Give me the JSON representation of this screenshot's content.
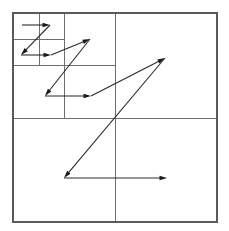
{
  "figure": {
    "background_color": "#ffffff",
    "line_color": "#6e6e6e",
    "frame_color": "#5a5a5a",
    "curve_color": "#2b2b2b",
    "arrow_color": "#1a1a1a"
  },
  "chart_data": {
    "type": "diagram",
    "subtype": "quadtree-z-order-curve",
    "xlabel": "",
    "ylabel": "",
    "grid": true,
    "legend": "none",
    "viewbox": {
      "x": 0,
      "y": 0,
      "width": 229,
      "height": 231
    },
    "domain": {
      "x0": 13,
      "y0": 13,
      "x1": 217,
      "y1": 222
    },
    "refinement_levels": 3,
    "split_points": [
      {
        "level": 1,
        "x": 115,
        "y": 118,
        "label": "root-split"
      },
      {
        "level": 2,
        "x": 64,
        "y": 65,
        "label": "top-left-quadrant-split"
      },
      {
        "level": 3,
        "x": 39,
        "y": 39,
        "label": "top-left-subquadrant-split"
      }
    ],
    "grid_lines": [
      {
        "name": "level1-vertical",
        "x1": 115,
        "y1": 13,
        "x2": 115,
        "y2": 222
      },
      {
        "name": "level1-horizontal",
        "x1": 13,
        "y1": 118,
        "x2": 217,
        "y2": 118
      },
      {
        "name": "level2-vertical",
        "x1": 64,
        "y1": 13,
        "x2": 64,
        "y2": 118
      },
      {
        "name": "level2-horizontal",
        "x1": 13,
        "y1": 65,
        "x2": 115,
        "y2": 65
      },
      {
        "name": "level3-vertical",
        "x1": 39,
        "y1": 13,
        "x2": 39,
        "y2": 65
      },
      {
        "name": "level3-horizontal",
        "x1": 13,
        "y1": 39,
        "x2": 64,
        "y2": 39
      }
    ],
    "curves": [
      {
        "name": "level3-z-curve",
        "level": 3,
        "order": [
          "nw",
          "ne",
          "sw",
          "se"
        ],
        "points": [
          {
            "x": 22,
            "y": 25
          },
          {
            "x": 50,
            "y": 25
          },
          {
            "x": 21,
            "y": 55
          },
          {
            "x": 51,
            "y": 55
          }
        ],
        "segments": [
          {
            "from": {
              "x": 22,
              "y": 25
            },
            "to": {
              "x": 50,
              "y": 25
            },
            "arrow": true,
            "kind": "horizontal"
          },
          {
            "from": {
              "x": 50,
              "y": 25
            },
            "to": {
              "x": 21,
              "y": 55
            },
            "arrow": true,
            "kind": "diagonal"
          },
          {
            "from": {
              "x": 21,
              "y": 55
            },
            "to": {
              "x": 51,
              "y": 55
            },
            "arrow": true,
            "kind": "horizontal"
          }
        ]
      },
      {
        "name": "level2-z-curve",
        "level": 2,
        "order": [
          "nw",
          "ne",
          "sw",
          "se"
        ],
        "points": [
          {
            "x": 51,
            "y": 55
          },
          {
            "x": 90,
            "y": 39
          },
          {
            "x": 45,
            "y": 96
          },
          {
            "x": 91,
            "y": 96
          }
        ],
        "segments": [
          {
            "from": {
              "x": 51,
              "y": 55
            },
            "to": {
              "x": 90,
              "y": 39
            },
            "arrow": true,
            "kind": "diagonal"
          },
          {
            "from": {
              "x": 90,
              "y": 39
            },
            "to": {
              "x": 45,
              "y": 96
            },
            "arrow": true,
            "kind": "diagonal"
          },
          {
            "from": {
              "x": 45,
              "y": 96
            },
            "to": {
              "x": 91,
              "y": 96
            },
            "arrow": true,
            "kind": "horizontal"
          }
        ]
      },
      {
        "name": "level1-z-curve",
        "level": 1,
        "order": [
          "nw",
          "ne",
          "sw",
          "se"
        ],
        "points": [
          {
            "x": 91,
            "y": 96
          },
          {
            "x": 165,
            "y": 58
          },
          {
            "x": 64,
            "y": 178
          },
          {
            "x": 167,
            "y": 178
          }
        ],
        "segments": [
          {
            "from": {
              "x": 91,
              "y": 96
            },
            "to": {
              "x": 165,
              "y": 58
            },
            "arrow": true,
            "kind": "diagonal"
          },
          {
            "from": {
              "x": 165,
              "y": 58
            },
            "to": {
              "x": 64,
              "y": 178
            },
            "arrow": true,
            "kind": "diagonal"
          },
          {
            "from": {
              "x": 64,
              "y": 178
            },
            "to": {
              "x": 167,
              "y": 178
            },
            "arrow": true,
            "kind": "horizontal"
          }
        ]
      }
    ]
  }
}
